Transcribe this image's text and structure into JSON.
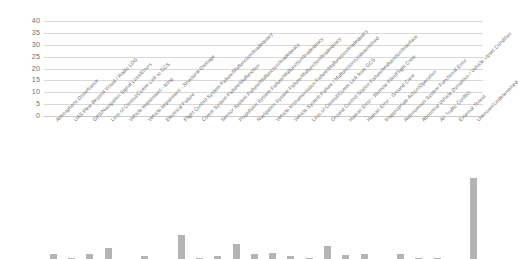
{
  "chart_data": {
    "type": "bar",
    "title": "",
    "xlabel": "",
    "ylabel": "",
    "ylim": [
      0,
      40
    ],
    "yticks": [
      0,
      5,
      10,
      15,
      20,
      25,
      30,
      35,
      40
    ],
    "grid": true,
    "legend": "none",
    "bar_color": "#b4b4b4",
    "categories": [
      "Atmospheric Disturbance",
      "UAS Flew Beyond Visual / Radio LOS",
      "GPS/Navigation Signal Loss/Errors",
      "Loss of Control/Comm Link to GCS",
      "Vehicle Impairment - Icing",
      "Vehicle Impairment - Structural Damage",
      "Electrical Failure",
      "Flight Control System Failure/Malfunction/Inadequacy",
      "Comm System Failure/Malfunction",
      "Sensor System Failure/Malfunction/Inadequacy",
      "Propulsion System Failure/Malfunction/Inadequacy",
      "Navigation System Failure/Malfunction/Inadequacy",
      "Vehicle Instrumentation Failure/Malfunction/Inadequacy",
      "Vehicle System Failure / Malfunction/Undetermined",
      "Loss of Control/Comm Link from GCS",
      "Ground Control Station Failure/Malfunction/Interface",
      "Human Error - Remote Pilot/Flight Crew",
      "Human Error - Ground Crew",
      "Inappropriate Action/Operation",
      "Autonomous System Functional Error",
      "Abnormal Vehicle Dynamics / Vehicle Upset Condition",
      "Air Traffic Conflict",
      "External Threat",
      "Unknown/Undetermined"
    ],
    "values": [
      2,
      0.6,
      2.2,
      4.7,
      0,
      1.2,
      0,
      10.3,
      0.6,
      1.3,
      6.3,
      2,
      2.5,
      1.1,
      0.4,
      5.3,
      1.6,
      2.1,
      0,
      2.3,
      0.4,
      0.3,
      0,
      34
    ]
  }
}
